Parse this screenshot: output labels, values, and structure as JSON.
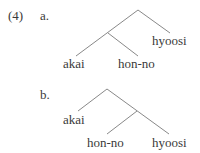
{
  "example": {
    "number": "(4)",
    "a": {
      "label": "a.",
      "leaves": [
        "akai",
        "hon-no",
        "hyoosi"
      ],
      "structure": "[[akai hon-no] hyoosi]"
    },
    "b": {
      "label": "b.",
      "leaves": [
        "akai",
        "hon-no",
        "hyoosi"
      ],
      "structure": "[akai [hon-no hyoosi]]"
    }
  }
}
